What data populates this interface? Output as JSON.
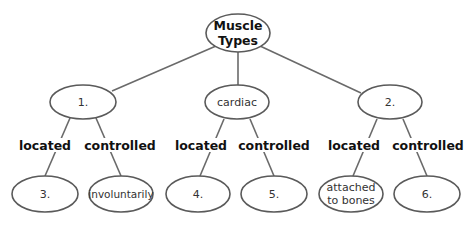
{
  "diagram": {
    "type": "concept-map",
    "root": {
      "label_line1": "Muscle",
      "label_line2": "Types"
    },
    "level1": [
      {
        "label": "1."
      },
      {
        "label": "cardiac"
      },
      {
        "label": "2."
      }
    ],
    "links": [
      {
        "label": "located"
      },
      {
        "label": "controlled"
      },
      {
        "label": "located"
      },
      {
        "label": "controlled"
      },
      {
        "label": "located"
      },
      {
        "label": "controlled"
      }
    ],
    "level2": [
      {
        "label": "3."
      },
      {
        "label": "involuntarily"
      },
      {
        "label": "4."
      },
      {
        "label": "5."
      },
      {
        "label_line1": "attached",
        "label_line2": "to bones"
      },
      {
        "label": "6."
      }
    ]
  }
}
